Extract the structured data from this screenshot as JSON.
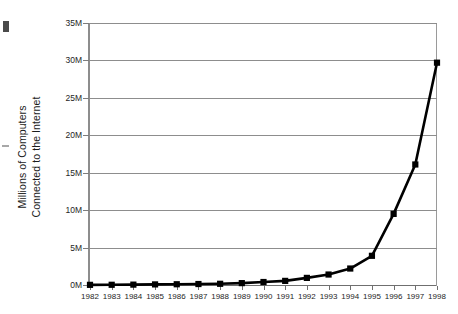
{
  "chart_data": {
    "type": "line",
    "title": "",
    "xlabel": "",
    "ylabel": "Millions of Computers Connected to the Internet",
    "ylabel_line1": "Millions of Computers",
    "ylabel_line2": "Connected to the Internet",
    "categories": [
      "1982",
      "1983",
      "1984",
      "1985",
      "1986",
      "1987",
      "1988",
      "1989",
      "1990",
      "1991",
      "1992",
      "1993",
      "1994",
      "1995",
      "1996",
      "1997",
      "1998"
    ],
    "x": [
      1982,
      1983,
      1984,
      1985,
      1986,
      1987,
      1988,
      1989,
      1990,
      1991,
      1992,
      1993,
      1994,
      1995,
      1996,
      1997,
      1998
    ],
    "values": [
      0.02,
      0.03,
      0.05,
      0.08,
      0.1,
      0.13,
      0.16,
      0.25,
      0.4,
      0.55,
      0.95,
      1.4,
      2.2,
      3.9,
      9.5,
      16.1,
      29.7
    ],
    "value_unit": "millions",
    "ylim": [
      0,
      35
    ],
    "xlim": [
      1982,
      1998
    ],
    "yticks": [
      0,
      5,
      10,
      15,
      20,
      25,
      30,
      35
    ],
    "ytick_labels": [
      "0M",
      "5M",
      "10M",
      "15M",
      "20M",
      "25M",
      "30M",
      "35M"
    ],
    "grid": "horizontal",
    "legend": "none",
    "marker": "square",
    "line_color": "#000000",
    "marker_color": "#000000",
    "grid_color": "#8d8d8d",
    "axis_color": "#6f6f6f",
    "background": "#ffffff"
  }
}
